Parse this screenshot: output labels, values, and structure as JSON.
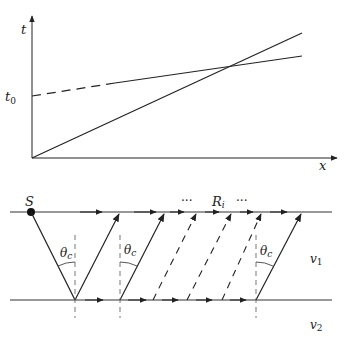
{
  "top_plot": {
    "y_axis_label": "t",
    "x_axis_label": "x",
    "intercept_label": "t",
    "intercept_subscript": "0"
  },
  "bottom_diagram": {
    "source_label": "S",
    "receiver_label": "R",
    "receiver_subscript": "i",
    "ellipsis_left": "···",
    "ellipsis_right": "···",
    "angle_label": "θ",
    "angle_subscript": "c",
    "layer1_label": "v",
    "layer1_subscript": "1",
    "layer2_label": "v",
    "layer2_subscript": "2"
  },
  "colors": {
    "line": "#222222",
    "background": "#ffffff"
  }
}
